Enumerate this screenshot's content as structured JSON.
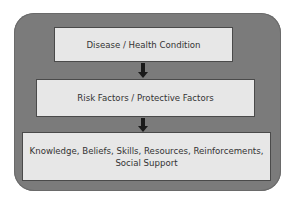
{
  "diagram": {
    "type": "flowchart",
    "direction": "top-to-bottom",
    "nodes": [
      {
        "id": "n1",
        "label": "Disease / Health Condition"
      },
      {
        "id": "n2",
        "label": "Risk Factors / Protective Factors"
      },
      {
        "id": "n3",
        "label": "Knowledge, Beliefs, Skills, Resources, Reinforcements, Social Support"
      }
    ],
    "edges": [
      {
        "from": "n3",
        "to": "n2",
        "arrow_points_to": "n2"
      },
      {
        "from": "n2",
        "to": "n1",
        "arrow_points_to": "n2"
      }
    ],
    "arrows": [
      {
        "between": [
          "n1",
          "n2"
        ],
        "direction": "down"
      },
      {
        "between": [
          "n2",
          "n3"
        ],
        "direction": "down"
      }
    ],
    "colors": {
      "container": "#7b7b7b",
      "box_fill": "#e7e7e7",
      "box_border": "#4a4a4a",
      "arrow": "#1a1a1a",
      "text": "#333333"
    }
  }
}
